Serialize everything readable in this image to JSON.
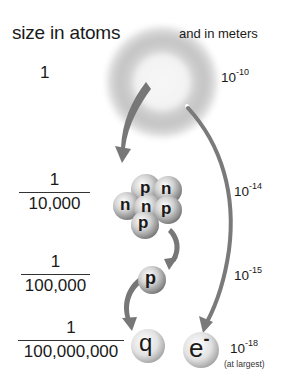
{
  "header": {
    "left": "size in atoms",
    "right": "and in meters"
  },
  "levels": [
    {
      "name": "atom",
      "size_atoms": {
        "numerator": "1",
        "denominator": ""
      },
      "size_meters": {
        "base": "10",
        "exponent": "-10"
      }
    },
    {
      "name": "nucleus",
      "size_atoms": {
        "numerator": "1",
        "denominator": "10,000"
      },
      "size_meters": {
        "base": "10",
        "exponent": "-14"
      }
    },
    {
      "name": "proton",
      "size_atoms": {
        "numerator": "1",
        "denominator": "100,000"
      },
      "size_meters": {
        "base": "10",
        "exponent": "-15"
      }
    },
    {
      "name": "quark-electron",
      "size_atoms": {
        "numerator": "1",
        "denominator": "100,000,000"
      },
      "size_meters": {
        "base": "10",
        "exponent": "-18",
        "note": "(at largest)"
      }
    }
  ],
  "nucleus_particles": [
    "p",
    "n",
    "n",
    "n",
    "p",
    "p"
  ],
  "proton_label": "p",
  "quark_label": "q",
  "electron_label": "e",
  "electron_charge": "-",
  "colors": {
    "arrow": "#777777",
    "cloud": "#bdbdbd",
    "text": "#1a1a1a"
  }
}
